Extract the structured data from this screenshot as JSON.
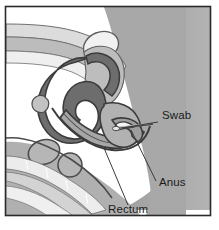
{
  "figure": {
    "kind": "medical-illustration",
    "frame": {
      "border_color": "#2b2b2b",
      "background_color": "#ffffff",
      "x": 5,
      "y": 6,
      "width": 206,
      "height": 210
    },
    "palette": {
      "outline": "#3a3a3a",
      "colon_dark_gray": "#6b6b6b",
      "buttock_mid_gray": "#a8a8a8",
      "tissue_light_gray": "#c9c9c9",
      "tissue_pale_gray": "#dedede",
      "bladder_white": "#f0f0f0",
      "bone_gray": "#b5b5b5",
      "paper_white": "#ffffff",
      "leader_line": "#3a3a3a",
      "text": "#1b1b1b"
    },
    "labels": [
      {
        "id": "swab",
        "text": "Swab",
        "text_x": 162,
        "text_y": 119,
        "leader": {
          "x1": 158,
          "y1": 122,
          "x2": 122,
          "y2": 128
        }
      },
      {
        "id": "anus",
        "text": "Anus",
        "text_x": 159,
        "text_y": 186,
        "leader": {
          "x1": 156,
          "y1": 181,
          "x2": 131,
          "y2": 130
        }
      },
      {
        "id": "rectum",
        "text": "Rectum",
        "text_x": 108,
        "text_y": 213,
        "leader": {
          "x1": 128,
          "y1": 205,
          "x2": 104,
          "y2": 148
        }
      }
    ],
    "structures": [
      {
        "id": "buttock-mass",
        "name": "buttock soft tissue block",
        "tone": "mid-gray"
      },
      {
        "id": "abdominal-wall",
        "name": "abdominal wall layered bands",
        "tone": "pale-gray"
      },
      {
        "id": "bladder",
        "name": "bladder",
        "tone": "near-white"
      },
      {
        "id": "sigmoid-colon",
        "name": "sigmoid colon loop",
        "tone": "dark-gray"
      },
      {
        "id": "rectum-tube",
        "name": "rectum",
        "tone": "mid-gray"
      },
      {
        "id": "anal-canal",
        "name": "anal canal",
        "tone": "mid-gray"
      },
      {
        "id": "sacrum-vertebrae",
        "name": "sacral vertebrae",
        "tone": "bone-gray"
      },
      {
        "id": "swab-stick",
        "name": "swab inserted into anal canal",
        "tone": "thin-line"
      }
    ]
  }
}
